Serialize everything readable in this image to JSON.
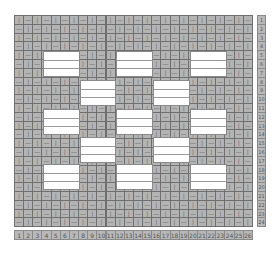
{
  "grid": {
    "cols": 26,
    "rows": 24,
    "left": 14,
    "top": 15,
    "cell_w": 9.15,
    "cell_h": 8.8,
    "glyphs": [
      "|",
      "—"
    ],
    "colors": {
      "cell_bg": "#b4b4b4",
      "cell_border": "#6f6f6f",
      "block_bg": "#ffffff",
      "glyph": "#6a6a6a"
    }
  },
  "blocks": [
    {
      "x": 43,
      "y": 51,
      "w": 37,
      "h": 26
    },
    {
      "x": 116,
      "y": 51,
      "w": 37,
      "h": 26
    },
    {
      "x": 190,
      "y": 51,
      "w": 37,
      "h": 26
    },
    {
      "x": 80,
      "y": 80,
      "w": 36,
      "h": 26
    },
    {
      "x": 153,
      "y": 80,
      "w": 37,
      "h": 26
    },
    {
      "x": 43,
      "y": 109,
      "w": 37,
      "h": 26
    },
    {
      "x": 116,
      "y": 109,
      "w": 37,
      "h": 26
    },
    {
      "x": 190,
      "y": 109,
      "w": 37,
      "h": 26
    },
    {
      "x": 80,
      "y": 137,
      "w": 36,
      "h": 26
    },
    {
      "x": 153,
      "y": 137,
      "w": 37,
      "h": 26
    },
    {
      "x": 43,
      "y": 164,
      "w": 37,
      "h": 26
    },
    {
      "x": 116,
      "y": 164,
      "w": 37,
      "h": 26
    },
    {
      "x": 190,
      "y": 164,
      "w": 37,
      "h": 26
    }
  ],
  "row_numbers": [
    "1",
    "2",
    "3",
    "4",
    "5",
    "6",
    "7",
    "8",
    "9",
    "10",
    "11",
    "12",
    "13",
    "14",
    "15",
    "16",
    "17",
    "18",
    "19",
    "20",
    "21",
    "22",
    "23",
    "24"
  ],
  "col_numbers": [
    "1",
    "2",
    "3",
    "4",
    "5",
    "6",
    "7",
    "8",
    "9",
    "10",
    "11",
    "12",
    "13",
    "14",
    "15",
    "16",
    "17",
    "18",
    "19",
    "20",
    "21",
    "22",
    "23",
    "24",
    "25",
    "26"
  ]
}
